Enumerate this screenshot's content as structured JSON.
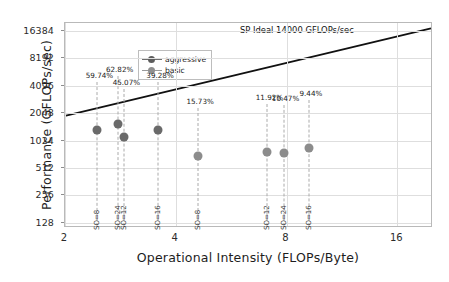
{
  "chart_data": {
    "type": "scatter",
    "title": "",
    "xlabel": "Operational Intensity (FLOPs/Byte)",
    "ylabel": "Performance (GFLOPs/sec)",
    "xscale": "log2",
    "yscale": "log2",
    "xlim": [
      2,
      20
    ],
    "ylim": [
      112,
      20000
    ],
    "xticks": [
      "2",
      "4",
      "8",
      "16"
    ],
    "xtick_values": [
      2,
      4,
      8,
      16
    ],
    "yticks": [
      "128",
      "256",
      "512",
      "1024",
      "2048",
      "4096",
      "8192",
      "16384"
    ],
    "ytick_values": [
      128,
      256,
      512,
      1024,
      2048,
      4096,
      8192,
      16384
    ],
    "grid": true,
    "legend_position": "upper-left",
    "legend": [
      {
        "name": "aggressive",
        "color": "#5c5c5c"
      },
      {
        "name": "basic",
        "color": "#8f8f8f"
      }
    ],
    "roofline": {
      "label": "SP Ideal 14000 GFLOPs/sec",
      "peak_gflops": 14000,
      "color": "#111111"
    },
    "series": [
      {
        "name": "aggressive",
        "color": "#6a6a6a",
        "points": [
          {
            "x": 2.45,
            "y": 1330,
            "pct_label": "59.74%",
            "so_label": "SO=8"
          },
          {
            "x": 2.78,
            "y": 1560,
            "pct_label": "62.82%",
            "so_label": "SO=24"
          },
          {
            "x": 2.9,
            "y": 1120,
            "pct_label": "45.07%",
            "so_label": "SO=12"
          },
          {
            "x": 3.58,
            "y": 1330,
            "pct_label": "39.28%",
            "so_label": "SO=16"
          }
        ]
      },
      {
        "name": "basic",
        "color": "#8c8c8c",
        "points": [
          {
            "x": 4.6,
            "y": 700,
            "pct_label": "15.73%",
            "so_label": "SO=8"
          },
          {
            "x": 7.1,
            "y": 760,
            "pct_label": "11.92%",
            "so_label": "SO=12"
          },
          {
            "x": 7.85,
            "y": 748,
            "pct_label": "10.47%",
            "so_label": "SO=24"
          },
          {
            "x": 9.2,
            "y": 850,
            "pct_label": "9.44%",
            "so_label": "SO=16"
          }
        ]
      }
    ]
  }
}
